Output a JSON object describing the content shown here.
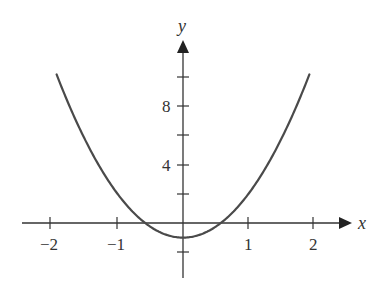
{
  "chart_data": {
    "type": "line",
    "title": "",
    "xlabel": "x",
    "ylabel": "y",
    "xlim": [
      -2.5,
      2.5
    ],
    "ylim": [
      -3,
      12
    ],
    "x_ticks": [
      -2,
      -1,
      1,
      2
    ],
    "x_tick_labels": [
      "−2",
      "−1",
      "1",
      "2"
    ],
    "y_ticks": [
      -2,
      2,
      4,
      6,
      8,
      10
    ],
    "y_tick_labels": [
      "",
      "",
      "4",
      "",
      "8",
      ""
    ],
    "grid": false,
    "legend": null,
    "series": [
      {
        "name": "y = 3x² − 1",
        "x": [
          -1.93,
          -1.5,
          -1,
          -0.577,
          0,
          0.577,
          1,
          1.5,
          1.93
        ],
        "y": [
          10.2,
          5.75,
          2,
          0,
          -1,
          0,
          2,
          5.75,
          10.2
        ]
      }
    ],
    "curve_color": "#4a4a4a",
    "axis_color": "#333333"
  }
}
